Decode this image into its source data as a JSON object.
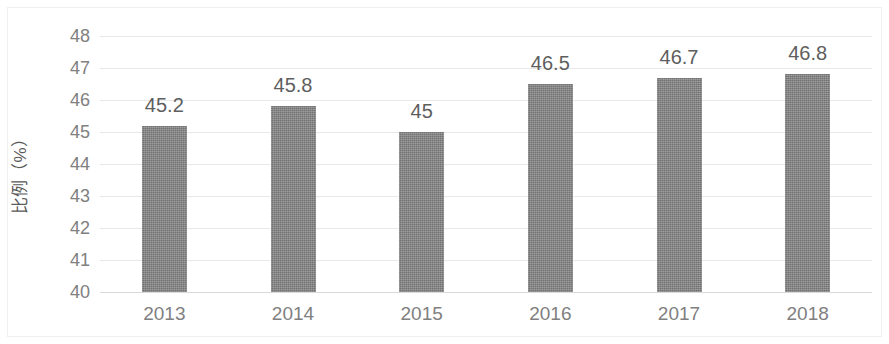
{
  "chart_data": {
    "type": "bar",
    "title": "",
    "subtitle": "",
    "xlabel": "",
    "ylabel": "比例（%）",
    "categories": [
      "2013",
      "2014",
      "2015",
      "2016",
      "2017",
      "2018"
    ],
    "values": [
      45.2,
      45.8,
      45,
      46.5,
      46.7,
      46.8
    ],
    "value_labels": [
      "45.2",
      "45.8",
      "45",
      "46.5",
      "46.7",
      "46.8"
    ],
    "series": [
      {
        "name": "",
        "values": [
          45.2,
          45.8,
          45,
          46.5,
          46.7,
          46.8
        ]
      }
    ],
    "ylim": [
      40,
      48
    ],
    "y_ticks": [
      48,
      47,
      46,
      45,
      44,
      43,
      42,
      41,
      40
    ],
    "y_tick_labels": [
      "48",
      "47",
      "46",
      "45",
      "44",
      "43",
      "42",
      "41",
      "40"
    ],
    "grid": true,
    "grid_axis": "y",
    "legend": false,
    "legend_position": "none",
    "bar_color": "#808080",
    "gridline_color": "#e8e8e8",
    "tick_label_color": "#808080",
    "value_label_color": "#5e5e5e",
    "background_color": "#ffffff"
  }
}
